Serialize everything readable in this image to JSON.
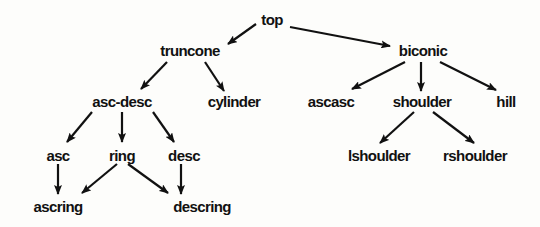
{
  "diagram": {
    "type": "tree",
    "nodes": [
      {
        "id": "top",
        "label": "top",
        "x": 272,
        "y": 19
      },
      {
        "id": "truncone",
        "label": "truncone",
        "x": 190,
        "y": 50
      },
      {
        "id": "biconic",
        "label": "biconic",
        "x": 423,
        "y": 50
      },
      {
        "id": "asc-desc",
        "label": "asc-desc",
        "x": 122,
        "y": 101
      },
      {
        "id": "cylinder",
        "label": "cylinder",
        "x": 234,
        "y": 101
      },
      {
        "id": "ascasc",
        "label": "ascasc",
        "x": 331,
        "y": 101
      },
      {
        "id": "shoulder",
        "label": "shoulder",
        "x": 422,
        "y": 101
      },
      {
        "id": "hill",
        "label": "hill",
        "x": 506,
        "y": 101
      },
      {
        "id": "asc",
        "label": "asc",
        "x": 58,
        "y": 155
      },
      {
        "id": "ring",
        "label": "ring",
        "x": 122,
        "y": 155
      },
      {
        "id": "desc",
        "label": "desc",
        "x": 184,
        "y": 155
      },
      {
        "id": "lshoulder",
        "label": "lshoulder",
        "x": 379,
        "y": 155
      },
      {
        "id": "rshoulder",
        "label": "rshoulder",
        "x": 475,
        "y": 155
      },
      {
        "id": "ascring",
        "label": "ascring",
        "x": 58,
        "y": 206
      },
      {
        "id": "descring",
        "label": "descring",
        "x": 202,
        "y": 206
      }
    ],
    "edges": [
      {
        "from": "top",
        "to": "truncone",
        "x1": 256,
        "y1": 24,
        "x2": 228,
        "y2": 44
      },
      {
        "from": "top",
        "to": "biconic",
        "x1": 290,
        "y1": 27,
        "x2": 390,
        "y2": 46
      },
      {
        "from": "truncone",
        "to": "asc-desc",
        "x1": 167,
        "y1": 62,
        "x2": 141,
        "y2": 89
      },
      {
        "from": "truncone",
        "to": "cylinder",
        "x1": 205,
        "y1": 62,
        "x2": 224,
        "y2": 91
      },
      {
        "from": "biconic",
        "to": "ascasc",
        "x1": 405,
        "y1": 62,
        "x2": 352,
        "y2": 89
      },
      {
        "from": "biconic",
        "to": "shoulder",
        "x1": 421,
        "y1": 62,
        "x2": 421,
        "y2": 91
      },
      {
        "from": "biconic",
        "to": "hill",
        "x1": 440,
        "y1": 62,
        "x2": 496,
        "y2": 90
      },
      {
        "from": "asc-desc",
        "to": "asc",
        "x1": 92,
        "y1": 112,
        "x2": 67,
        "y2": 142
      },
      {
        "from": "asc-desc",
        "to": "ring",
        "x1": 122,
        "y1": 112,
        "x2": 122,
        "y2": 142
      },
      {
        "from": "asc-desc",
        "to": "desc",
        "x1": 153,
        "y1": 112,
        "x2": 174,
        "y2": 142
      },
      {
        "from": "shoulder",
        "to": "lshoulder",
        "x1": 414,
        "y1": 112,
        "x2": 380,
        "y2": 143
      },
      {
        "from": "shoulder",
        "to": "rshoulder",
        "x1": 433,
        "y1": 112,
        "x2": 474,
        "y2": 143
      },
      {
        "from": "asc",
        "to": "ascring",
        "x1": 58,
        "y1": 164,
        "x2": 58,
        "y2": 194
      },
      {
        "from": "ring",
        "to": "ascring",
        "x1": 117,
        "y1": 164,
        "x2": 82,
        "y2": 193
      },
      {
        "from": "ring",
        "to": "descring",
        "x1": 128,
        "y1": 164,
        "x2": 168,
        "y2": 193
      },
      {
        "from": "desc",
        "to": "descring",
        "x1": 181,
        "y1": 164,
        "x2": 181,
        "y2": 194
      }
    ],
    "colors": {
      "background": "#fdfdfb",
      "ink": "#111111"
    }
  }
}
